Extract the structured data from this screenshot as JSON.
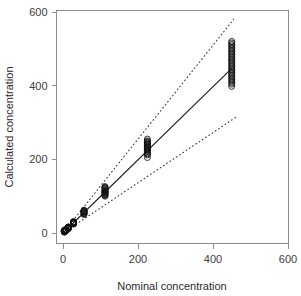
{
  "chart_data": {
    "type": "scatter",
    "title": "",
    "xlabel": "Nominal concentration",
    "ylabel": "Calculated concentration",
    "xlim": [
      0,
      600
    ],
    "ylim": [
      0,
      600
    ],
    "xticks": [
      0,
      200,
      400,
      600
    ],
    "yticks": [
      0,
      200,
      400,
      600
    ],
    "xtick_labels": [
      "0",
      "200",
      "400",
      "600"
    ],
    "ytick_labels": [
      "0",
      "200",
      "400",
      "600"
    ],
    "grid": false,
    "legend": "none",
    "marker": "open-circle",
    "marker_size": 3,
    "series": [
      {
        "name": "samples",
        "type": "scatter",
        "points": [
          [
            3.5,
            3.0
          ],
          [
            3.5,
            4.4
          ],
          [
            3.5,
            5.2
          ],
          [
            3.5,
            6.1
          ],
          [
            3.5,
            2.2
          ],
          [
            3.5,
            7.0
          ],
          [
            3.5,
            3.8
          ],
          [
            3.5,
            5.8
          ],
          [
            3.5,
            4.0
          ],
          [
            3.5,
            6.6
          ],
          [
            7.0,
            6.2
          ],
          [
            7.0,
            7.6
          ],
          [
            7.0,
            8.8
          ],
          [
            7.0,
            5.4
          ],
          [
            7.0,
            9.6
          ],
          [
            7.0,
            7.0
          ],
          [
            7.0,
            8.1
          ],
          [
            7.0,
            6.8
          ],
          [
            7.0,
            9.0
          ],
          [
            7.0,
            5.9
          ],
          [
            14.0,
            12.4
          ],
          [
            14.0,
            14.0
          ],
          [
            14.0,
            15.4
          ],
          [
            14.0,
            11.2
          ],
          [
            14.0,
            16.5
          ],
          [
            14.0,
            13.2
          ],
          [
            14.0,
            14.8
          ],
          [
            14.0,
            12.9
          ],
          [
            14.0,
            15.9
          ],
          [
            14.0,
            13.6
          ],
          [
            28.0,
            25.5
          ],
          [
            28.0,
            27.3
          ],
          [
            28.0,
            29.6
          ],
          [
            28.0,
            24.1
          ],
          [
            28.0,
            31.0
          ],
          [
            28.0,
            26.6
          ],
          [
            28.0,
            28.5
          ],
          [
            28.0,
            30.2
          ],
          [
            28.0,
            26.0
          ],
          [
            28.0,
            28.9
          ],
          [
            56.0,
            53.0
          ],
          [
            56.0,
            56.0
          ],
          [
            56.0,
            59.5
          ],
          [
            56.0,
            50.5
          ],
          [
            56.0,
            62.0
          ],
          [
            56.0,
            54.5
          ],
          [
            56.0,
            57.8
          ],
          [
            56.0,
            60.5
          ],
          [
            56.0,
            52.0
          ],
          [
            56.0,
            58.5
          ],
          [
            112.0,
            100.0
          ],
          [
            112.0,
            104.0
          ],
          [
            112.0,
            108.0
          ],
          [
            112.0,
            112.0
          ],
          [
            112.0,
            116.0
          ],
          [
            112.0,
            120.0
          ],
          [
            112.0,
            124.0
          ],
          [
            112.0,
            106.0
          ],
          [
            112.0,
            110.0
          ],
          [
            112.0,
            114.0
          ],
          [
            112.0,
            118.0
          ],
          [
            112.0,
            122.0
          ],
          [
            112.0,
            102.0
          ],
          [
            112.0,
            126.0
          ],
          [
            112.0,
            113.0
          ],
          [
            112.0,
            109.0
          ],
          [
            225.0,
            205.0
          ],
          [
            225.0,
            212.0
          ],
          [
            225.0,
            218.0
          ],
          [
            225.0,
            222.0
          ],
          [
            225.0,
            226.0
          ],
          [
            225.0,
            230.0
          ],
          [
            225.0,
            234.0
          ],
          [
            225.0,
            238.0
          ],
          [
            225.0,
            242.0
          ],
          [
            225.0,
            246.0
          ],
          [
            225.0,
            250.0
          ],
          [
            225.0,
            255.0
          ],
          [
            225.0,
            215.0
          ],
          [
            225.0,
            224.0
          ],
          [
            225.0,
            228.0
          ],
          [
            225.0,
            232.0
          ],
          [
            225.0,
            236.0
          ],
          [
            225.0,
            240.0
          ],
          [
            225.0,
            244.0
          ],
          [
            225.0,
            248.0
          ],
          [
            450.0,
            398.0
          ],
          [
            450.0,
            408.0
          ],
          [
            450.0,
            416.0
          ],
          [
            450.0,
            424.0
          ],
          [
            450.0,
            432.0
          ],
          [
            450.0,
            440.0
          ],
          [
            450.0,
            448.0
          ],
          [
            450.0,
            456.0
          ],
          [
            450.0,
            464.0
          ],
          [
            450.0,
            472.0
          ],
          [
            450.0,
            480.0
          ],
          [
            450.0,
            488.0
          ],
          [
            450.0,
            496.0
          ],
          [
            450.0,
            504.0
          ],
          [
            450.0,
            512.0
          ],
          [
            450.0,
            520.0
          ],
          [
            450.0,
            404.0
          ],
          [
            450.0,
            412.0
          ],
          [
            450.0,
            420.0
          ],
          [
            450.0,
            428.0
          ],
          [
            450.0,
            436.0
          ],
          [
            450.0,
            444.0
          ],
          [
            450.0,
            452.0
          ],
          [
            450.0,
            460.0
          ],
          [
            450.0,
            468.0
          ],
          [
            450.0,
            476.0
          ],
          [
            450.0,
            484.0
          ],
          [
            450.0,
            492.0
          ],
          [
            450.0,
            500.0
          ],
          [
            450.0,
            508.0
          ],
          [
            450.0,
            516.0
          ]
        ]
      }
    ],
    "lines": [
      {
        "name": "regression-line",
        "style": "solid",
        "from": [
          0,
          0
        ],
        "to": [
          450,
          447
        ]
      },
      {
        "name": "upper-confidence-limit",
        "style": "dotted",
        "from": [
          0,
          0
        ],
        "to": [
          455,
          580
        ]
      },
      {
        "name": "lower-confidence-limit",
        "style": "dotted",
        "from": [
          0,
          0
        ],
        "to": [
          462,
          315
        ]
      }
    ]
  },
  "colors": {
    "axis": "#8c8c8c",
    "text": "#2b2b2b",
    "marker": "#111111",
    "fit_line": "#1a1a1a",
    "ci_line": "#3a3a3a",
    "background": "#ffffff"
  }
}
